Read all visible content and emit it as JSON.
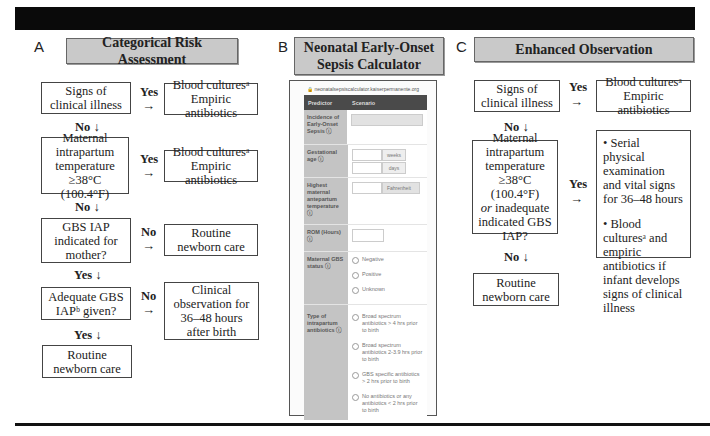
{
  "panels": {
    "A": {
      "letter": "A",
      "title": "Categorical Risk Assessment",
      "nodes": {
        "signs": "Signs of clinical illness",
        "signs_yes_label": "Yes",
        "signs_yes_result": "Blood culturesᵃ Empiric antibiotics",
        "signs_no_label": "No ↓",
        "maternal": "Maternal intrapartum temperature ≥38°C (100.4°F)",
        "maternal_yes_label": "Yes",
        "maternal_yes_result": "Blood culturesᵃ Empiric antibiotics",
        "maternal_no_label": "No ↓",
        "gbs": "GBS IAP indicated for mother?",
        "gbs_no_label": "No",
        "gbs_no_result": "Routine newborn care",
        "gbs_yes_label": "Yes ↓",
        "adequate": "Adequate GBS IAPᵇ given?",
        "adequate_no_label": "No",
        "adequate_no_result": "Clinical observation for 36–48 hours after birth",
        "adequate_yes_label": "Yes ↓",
        "final": "Routine newborn care"
      },
      "arrow": "→"
    },
    "B": {
      "letter": "B",
      "title": "Neonatal Early-Onset Sepsis Calculator",
      "url": "🔒 neonatalsepsiscalculator.kaiserpermanente.org",
      "table_headers": [
        "Predictor",
        "Scenario"
      ],
      "rows": {
        "incidence": "Incidence of Early-Onset Sepsis ⓘ",
        "gestational": "Gestational age ⓘ",
        "weeks": "weeks",
        "days": "days",
        "temperature": "Highest maternal antepartum temperature ⓘ",
        "temp_unit": "Fahrenheit",
        "rom": "ROM (Hours) ⓘ",
        "gbs_status": "Maternal GBS status ⓘ",
        "gbs_options": [
          "Negative",
          "Positive",
          "Unknown"
        ],
        "antibiotics": "Type of intrapartum antibiotics ⓘ",
        "antibiotic_options": [
          "Broad spectrum antibiotics > 4 hrs prior to birth",
          "Broad spectrum antibiotics 2-3.9 hrs prior to birth",
          "GBS specific antibiotics > 2 hrs prior to birth",
          "No antibiotics or any antibiotics < 2 hrs prior to birth"
        ]
      }
    },
    "C": {
      "letter": "C",
      "title": "Enhanced Observation",
      "nodes": {
        "signs": "Signs of clinical illness",
        "signs_yes_label": "Yes",
        "signs_yes_result": "Blood culturesᵃ Empiric antibiotics",
        "signs_no_label": "No ↓",
        "maternal_a": "Maternal intrapartum temperature ≥38°C (100.4°F)",
        "maternal_or": "or",
        "maternal_b": "inadequate indicated GBS IAP?",
        "maternal_yes_label": "Yes",
        "bullet1": "• Serial physical examination and vital signs for 36–48 hours",
        "bullet2": "• Blood culturesᵃ and empiric antibiotics if infant develops signs of clinical illness",
        "maternal_no_label": "No ↓",
        "final": "Routine newborn care"
      },
      "arrow": "→"
    }
  }
}
